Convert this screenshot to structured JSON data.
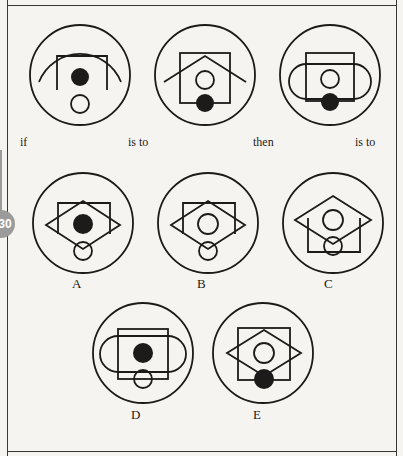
{
  "page": {
    "badge_number": "30",
    "background_color": "#f6f4f1",
    "ink_color": "#1d1b19",
    "badge_color": "#9b9b9b"
  },
  "analogy": {
    "connectors": [
      {
        "id": "if",
        "label": "if"
      },
      {
        "id": "is-to-1",
        "label": "is to"
      },
      {
        "id": "then",
        "label": "then"
      },
      {
        "id": "is-to-2",
        "label": "is to"
      }
    ]
  },
  "prompt_figures": [
    {
      "id": "prompt-1",
      "position": "top-left",
      "elements": [
        "outer-circle",
        "open-bottom-rectangle",
        "wide-arc",
        "filled-dot",
        "open-circle"
      ],
      "shapes": {
        "outer_circle": true,
        "rectangle_open_bottom": true,
        "arc": true,
        "center_dot": "filled",
        "lower_circle": "open"
      }
    },
    {
      "id": "prompt-2",
      "position": "top-middle",
      "elements": [
        "outer-circle",
        "square",
        "roof-chevron",
        "open-circle",
        "filled-dot"
      ],
      "shapes": {
        "outer_circle": true,
        "square": true,
        "chevron": true,
        "center_circle": "open",
        "lower_dot": "filled"
      }
    },
    {
      "id": "prompt-3",
      "position": "top-right",
      "elements": [
        "outer-circle",
        "square",
        "horizontal-stadium",
        "open-circle",
        "filled-dot"
      ],
      "shapes": {
        "outer_circle": true,
        "square": true,
        "stadium": true,
        "center_circle": "open",
        "lower_dot": "filled"
      }
    }
  ],
  "options": [
    {
      "id": "option-a",
      "label": "A",
      "elements": [
        "outer-circle",
        "open-bottom-rectangle",
        "diamond",
        "filled-dot",
        "open-circle"
      ],
      "shapes": {
        "outer_circle": true,
        "rectangle_open_bottom": true,
        "diamond": true,
        "center_dot": "filled",
        "lower_circle": "open"
      }
    },
    {
      "id": "option-b",
      "label": "B",
      "elements": [
        "outer-circle",
        "open-bottom-rectangle",
        "diamond",
        "open-circle",
        "open-circle"
      ],
      "shapes": {
        "outer_circle": true,
        "rectangle_open_bottom": true,
        "diamond": true,
        "center_dot": "open",
        "lower_circle": "open"
      }
    },
    {
      "id": "option-c",
      "label": "C",
      "elements": [
        "outer-circle",
        "diamond",
        "open-top-rectangle",
        "open-circle",
        "open-circle"
      ],
      "shapes": {
        "outer_circle": true,
        "rectangle_open_top": true,
        "diamond": true,
        "center_dot": "open",
        "lower_circle": "open"
      }
    },
    {
      "id": "option-d",
      "label": "D",
      "elements": [
        "outer-circle",
        "square",
        "horizontal-stadium",
        "filled-dot",
        "open-circle"
      ],
      "shapes": {
        "outer_circle": true,
        "square": true,
        "stadium": true,
        "center_dot": "filled",
        "lower_circle": "open"
      }
    },
    {
      "id": "option-e",
      "label": "E",
      "elements": [
        "outer-circle",
        "square",
        "diamond",
        "open-circle",
        "filled-dot"
      ],
      "shapes": {
        "outer_circle": true,
        "square": true,
        "diamond": true,
        "center_circle": "open",
        "lower_dot": "filled"
      }
    }
  ]
}
